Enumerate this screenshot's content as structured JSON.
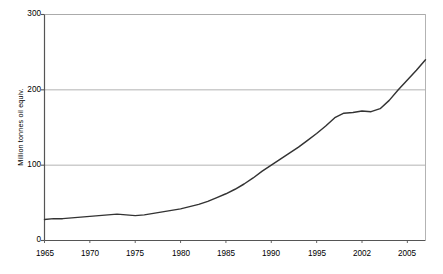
{
  "chart_data": {
    "type": "line",
    "title": "",
    "xlabel": "",
    "ylabel": "Million tonnes oil equiv.",
    "xlim": [
      1965,
      2007
    ],
    "ylim": [
      0,
      300
    ],
    "yticks": [
      0,
      100,
      200,
      300
    ],
    "ytick_labels": [
      "0",
      "100",
      "200",
      "300"
    ],
    "xticks": [
      1965,
      1970,
      1975,
      1980,
      1985,
      1990,
      1995,
      2000,
      2005
    ],
    "xtick_labels": [
      "1965",
      "1970",
      "1975",
      "1980",
      "1985",
      "1990",
      "1995",
      "2002",
      "2005"
    ],
    "grid": "horizontal",
    "legend": "none",
    "line_color": "#333333",
    "axis_color": "#555555",
    "grid_color": "#aaaaaa",
    "background": "#ffffff",
    "series": [
      {
        "name": "Million tonnes oil equiv.",
        "x": [
          1965,
          1966,
          1967,
          1968,
          1969,
          1970,
          1971,
          1972,
          1973,
          1974,
          1975,
          1976,
          1977,
          1978,
          1979,
          1980,
          1981,
          1982,
          1983,
          1984,
          1985,
          1986,
          1987,
          1988,
          1989,
          1990,
          1991,
          1992,
          1993,
          1994,
          1995,
          1996,
          1997,
          1998,
          1999,
          2000,
          2001,
          2002,
          2003,
          2004,
          2005,
          2006,
          2007
        ],
        "values": [
          28,
          29,
          29,
          30,
          31,
          32,
          33,
          34,
          35,
          34,
          33,
          34,
          36,
          38,
          40,
          42,
          45,
          48,
          52,
          57,
          62,
          68,
          75,
          83,
          92,
          100,
          108,
          116,
          124,
          133,
          142,
          152,
          163,
          169,
          170,
          172,
          171,
          175,
          186,
          200,
          213,
          226,
          240
        ]
      }
    ]
  },
  "axis": {
    "ytitle": "Million tonnes oil equiv."
  }
}
